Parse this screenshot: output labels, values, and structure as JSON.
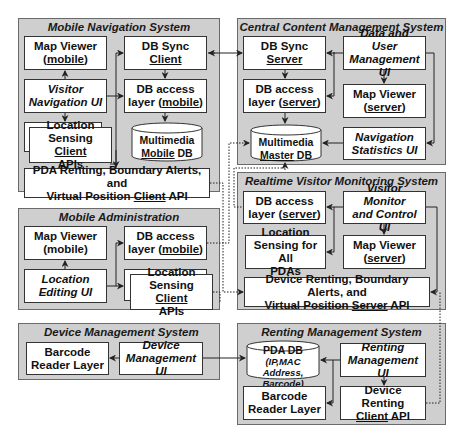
{
  "systems": {
    "mobile_navigation": {
      "title": "Mobile Navigation System",
      "map_viewer": {
        "line1": "Map Viewer",
        "line2_u": "mobile"
      },
      "db_sync_client": {
        "line1": "DB Sync",
        "line2_u": "Client"
      },
      "visitor_navigation_ui": {
        "line1": "Visitor",
        "line2": "Navigation UI"
      },
      "db_access_layer": {
        "line1": "DB access",
        "line2_pre": "layer (",
        "line2_u": "mobile",
        "line2_post": ")"
      },
      "location_sensing": {
        "line1": "Location",
        "line2_pre": "Sensing ",
        "line2_u": "Client",
        "line3": "APIs"
      },
      "multimedia_db": {
        "line1": "Multimedia",
        "line2_u": "Mobile",
        "line2_post": " DB"
      },
      "pda_api": {
        "line1": "PDA Renting, Boundary Alerts, and",
        "line2_pre": "Virtual Position ",
        "line2_u": "Client",
        "line2_post": " API"
      }
    },
    "mobile_administration": {
      "title": "Mobile Administration",
      "map_viewer": {
        "line1": "Map Viewer",
        "line2": "(mobile)"
      },
      "db_access_layer": {
        "line1": "DB access",
        "line2_pre": "layer (",
        "line2_u": "mobile",
        "line2_post": ")"
      },
      "location_editing_ui": {
        "line1": "Location",
        "line2": "Editing UI"
      },
      "location_sensing": {
        "line1": "Location",
        "line2_pre": "Sensing ",
        "line2_u": "Client",
        "line3": "APIs"
      }
    },
    "central_content": {
      "title": "Central Content Management System",
      "db_sync_server": {
        "line1": "DB Sync",
        "line2_u": "Server"
      },
      "data_user_ui": {
        "line1": "Data  and User",
        "line2": "Management UI"
      },
      "db_access_layer": {
        "line1": "DB access",
        "line2_pre": "layer (",
        "line2_u": "server",
        "line2_post": ")"
      },
      "map_viewer": {
        "line1": "Map Viewer",
        "line2_u": "server"
      },
      "multimedia_db": {
        "line1": "Multimedia",
        "line2_u": "Master",
        "line2_post": " DB"
      },
      "nav_stats_ui": {
        "line1": "Navigation",
        "line2": "Statistics UI"
      }
    },
    "realtime_monitoring": {
      "title": "Realtime Visitor Monitoring System",
      "db_access_layer": {
        "line1": "DB access",
        "line2_pre": "layer (",
        "line2_u": "server",
        "line2_post": ")"
      },
      "monitor_ui": {
        "line1": "Visitor Monitor",
        "line2": "and Control UI"
      },
      "location_sensing": {
        "line1": "Location",
        "line2": "Sensing for All",
        "line3": "PDAs"
      },
      "map_viewer": {
        "line1": "Map Viewer",
        "line2_u": "server"
      },
      "server_api": {
        "line1": "Device Renting, Boundary Alerts, and",
        "line2_pre": "Virtual Position ",
        "line2_u": "Server",
        "line2_post": " API"
      }
    },
    "device_management": {
      "title": "Device Management System",
      "barcode_reader": {
        "line1": "Barcode",
        "line2": "Reader Layer"
      },
      "device_ui": {
        "line1": "Device",
        "line2": "Management UI"
      }
    },
    "renting_management": {
      "title": "Renting Management System",
      "pda_db": {
        "line1": "PDA DB",
        "line2": "(IP,MAC Address,",
        "line3": "Barcode)"
      },
      "renting_ui": {
        "line1": "Renting",
        "line2": "Management UI"
      },
      "barcode_reader": {
        "line1": "Barcode",
        "line2": "Reader Layer"
      },
      "device_renting_client": {
        "line1": "Device Renting",
        "line2_u": "Client",
        "line2_post": " API"
      }
    }
  },
  "colors": {
    "system_bg": "#cfcfcf",
    "box_bg": "#ffffff",
    "line": "#222222"
  }
}
